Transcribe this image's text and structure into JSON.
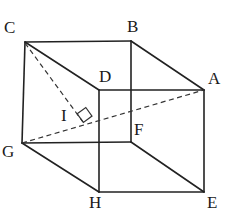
{
  "figure": {
    "type": "geometry-diagram",
    "width": 237,
    "height": 215,
    "stroke_color": "#222222",
    "background_color": "#ffffff",
    "solid_stroke_width": 1.6,
    "dashed_stroke_width": 1.2,
    "dash_pattern": "5,3.5"
  },
  "vertices": [
    {
      "name": "C",
      "label": "C",
      "x": 25,
      "y": 42,
      "label_x": 4,
      "label_y": 19
    },
    {
      "name": "B",
      "label": "B",
      "x": 131,
      "y": 41,
      "label_x": 127,
      "label_y": 18
    },
    {
      "name": "D",
      "label": "D",
      "x": 99,
      "y": 90,
      "label_x": 99,
      "label_y": 68
    },
    {
      "name": "A",
      "label": "A",
      "x": 204,
      "y": 90,
      "label_x": 208,
      "label_y": 70
    },
    {
      "name": "G",
      "label": "G",
      "x": 22,
      "y": 143,
      "label_x": 2,
      "label_y": 143
    },
    {
      "name": "F",
      "label": "F",
      "x": 131,
      "y": 142,
      "label_x": 134,
      "label_y": 121
    },
    {
      "name": "H",
      "label": "H",
      "x": 99,
      "y": 192,
      "label_x": 89,
      "label_y": 194
    },
    {
      "name": "E",
      "label": "E",
      "x": 204,
      "y": 192,
      "label_x": 207,
      "label_y": 194
    },
    {
      "name": "I",
      "label": "I",
      "x": 83,
      "y": 122,
      "label_x": 61,
      "label_y": 107
    }
  ],
  "solid_edges": [
    {
      "name": "edge-C-B",
      "from": "C",
      "to": "B"
    },
    {
      "name": "edge-B-A",
      "from": "B",
      "to": "A"
    },
    {
      "name": "edge-C-D",
      "from": "C",
      "to": "D"
    },
    {
      "name": "edge-D-A",
      "from": "D",
      "to": "A"
    },
    {
      "name": "edge-D-F",
      "from": "D",
      "to": "F"
    },
    {
      "name": "edge-B-F",
      "from": "B",
      "to": "F"
    },
    {
      "name": "edge-C-G",
      "from": "C",
      "to": "G"
    },
    {
      "name": "edge-A-E",
      "from": "A",
      "to": "E"
    },
    {
      "name": "edge-G-F",
      "from": "G",
      "to": "F"
    },
    {
      "name": "edge-G-H",
      "from": "G",
      "to": "H"
    },
    {
      "name": "edge-F-E",
      "from": "F",
      "to": "E"
    },
    {
      "name": "edge-H-E",
      "from": "H",
      "to": "E"
    },
    {
      "name": "edge-D-H",
      "from": "D",
      "to": "H"
    }
  ],
  "dashed_edges": [
    {
      "name": "diagonal-G-A",
      "from": "G",
      "to": "A"
    },
    {
      "name": "perpendicular-C-I",
      "from": "C",
      "to": "I"
    }
  ],
  "right_angle_marker": {
    "name": "right-angle-at-I",
    "vertex_x": 83,
    "vertex_y": 122,
    "size": 9,
    "description": "right angle between CI and GA at point I"
  },
  "labels": {
    "C": "C",
    "B": "B",
    "D": "D",
    "A": "A",
    "G": "G",
    "F": "F",
    "H": "H",
    "E": "E",
    "I": "I"
  }
}
